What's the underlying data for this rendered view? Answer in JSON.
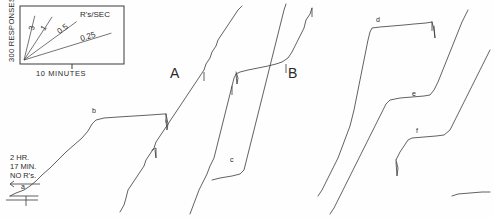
{
  "figure": {
    "type": "cumulative-record",
    "background": "#fefefe",
    "ink": "#3a3a3a",
    "width": 494,
    "height": 218
  },
  "legend": {
    "name": "rate-legend-inset",
    "box": {
      "x": 20,
      "y": 6,
      "w": 104,
      "h": 58
    },
    "y_axis_label": "300 RESPONSES",
    "x_axis_label": "10 MINUTES",
    "rate_units": "R's/SEC",
    "slope_labels": [
      "3",
      "1",
      "0.5",
      "0.25"
    ],
    "slopes": [
      {
        "label": "3",
        "tx": 0.115,
        "ty": 0.92
      },
      {
        "label": "1",
        "tx": 0.3,
        "ty": 0.9
      },
      {
        "label": "0.5",
        "tx": 0.56,
        "ty": 0.8
      },
      {
        "label": "0.25",
        "tx": 0.93,
        "ty": 0.56
      }
    ]
  },
  "annotations": {
    "session_note": [
      "2 HR.",
      "17 MIN.",
      "NO R's."
    ],
    "segment_labels": [
      {
        "id": "A",
        "text": "A",
        "x": 170,
        "y": 78
      },
      {
        "id": "B",
        "text": "B",
        "x": 288,
        "y": 78
      }
    ],
    "event_labels": [
      {
        "id": "a",
        "text": "a",
        "x": 21,
        "y": 189
      },
      {
        "id": "b",
        "text": "b",
        "x": 92,
        "y": 113
      },
      {
        "id": "c",
        "text": "c",
        "x": 230,
        "y": 162
      },
      {
        "id": "d",
        "text": "d",
        "x": 376,
        "y": 22
      },
      {
        "id": "e",
        "text": "e",
        "x": 412,
        "y": 96
      },
      {
        "id": "f",
        "text": "f",
        "x": 416,
        "y": 133
      }
    ]
  },
  "chart_data": {
    "type": "line",
    "title": "",
    "subtitle": "",
    "xlabel": "10 MINUTES",
    "ylabel": "300 RESPONSES",
    "grid": false,
    "legend_position": "inset-top-left",
    "axis_note": "Cumulative responses vs. time; pen resets downward at ceiling.",
    "series": [
      {
        "name": "record-1",
        "points": "10,196 16,193 24,190 30,186 36,181 42,175 50,168 58,160 66,152 74,145 82,138 88,131 92,124 96,120 104,118 118,117 134,116 150,115 164,114 166,114"
      },
      {
        "name": "record-1-reset",
        "points": "166,114 168,124 167,130 166,120"
      },
      {
        "name": "record-2",
        "points": "120,212 124,205 126,198 128,190 132,184 136,178 140,172 144,166 146,160 150,154 154,148 156,142 160,136 164,130 168,124 172,118 176,112 180,106 184,100 188,94 192,88 196,82 200,76 204,70 206,64 210,58 212,52 216,46 218,40 222,34 226,28 230,22 234,16 238,10 242,6"
      },
      {
        "name": "record-2-reset",
        "points": "152,150 156,148 156,158 155,150"
      },
      {
        "name": "record-3",
        "points": "190,214 193,206 196,198 199,190 203,182 207,174 210,166 214,158 216,150 218,142 220,134 222,126 224,118 226,110 228,102 230,94 232,86 234,78 236,74 240,72 248,70 258,68 268,66 276,64 282,62 288,58 292,52 296,44 300,36 304,28 306,20 310,14 312,8"
      },
      {
        "name": "record-3-reset",
        "points": "236,72 238,78 237,84 236,74"
      },
      {
        "name": "record-4",
        "points": "212,180 220,178 232,176 240,174 244,170 246,162 248,154 250,146 252,138 254,130 256,122 258,114 260,106 262,98 264,90 266,82 268,74 270,66 272,58 274,50 276,42 278,34 280,26 282,18 284,10 286,4"
      },
      {
        "name": "record-5",
        "points": "318,196 322,190 326,182 330,174 334,166 338,158 341,150 344,142 347,134 350,126 352,118 354,110 356,100 358,90 360,80 362,70 364,60 366,50 368,40 370,32 372,28 380,27 392,26 404,25 414,24 426,23 432,22"
      },
      {
        "name": "record-5-reset",
        "points": "432,22 434,30 435,38 434,26"
      },
      {
        "name": "record-6",
        "points": "330,214 334,208 338,200 342,192 346,184 350,176 354,168 358,160 362,152 366,144 370,136 374,128 378,120 382,112 386,104 390,100 400,98 412,97 424,96 430,95 434,90 438,82 442,72 446,62 450,52 454,42 458,32 462,22 466,14 468,10"
      },
      {
        "name": "record-7",
        "points": "396,160 400,152 404,146 408,140 412,138 424,137 436,136 444,135 450,130 454,122 458,114 462,106 466,98 470,90 474,82 478,74 482,66 486,58 490,50"
      },
      {
        "name": "record-7-reset",
        "points": "396,160 398,168 397,176 396,162"
      },
      {
        "name": "record-0-baseline",
        "points": "10,196 24,196 38,196"
      },
      {
        "name": "record-8",
        "points": "452,196 458,194 470,193 482,192 490,192"
      }
    ],
    "event_ticks": [
      {
        "x": 166,
        "y": 114
      },
      {
        "x": 204,
        "y": 72
      },
      {
        "x": 232,
        "y": 86
      },
      {
        "x": 286,
        "y": 64
      },
      {
        "x": 312,
        "y": 8
      },
      {
        "x": 432,
        "y": 22
      }
    ]
  }
}
